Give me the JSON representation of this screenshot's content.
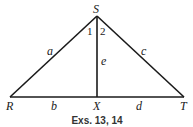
{
  "figure": {
    "vertices": {
      "S": "S",
      "R": "R",
      "X": "X",
      "T": "T"
    },
    "angles": {
      "angle1": "1",
      "angle2": "2"
    },
    "sides": {
      "a": "a",
      "b": "b",
      "c": "c",
      "d": "d",
      "e": "e"
    },
    "caption": "Exs. 13, 14",
    "line_color": "#1a1a1a"
  }
}
